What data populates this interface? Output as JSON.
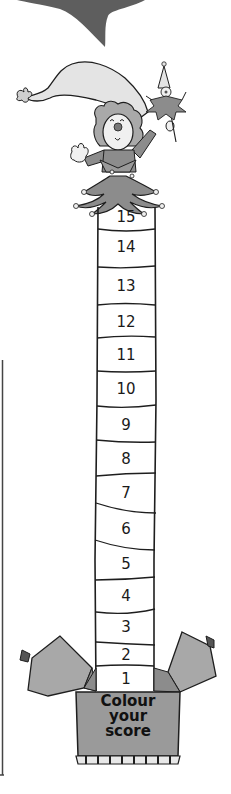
{
  "score_tower": {
    "instruction_lines": [
      "Colour",
      "your",
      "score"
    ],
    "levels": [
      {
        "label": "15",
        "top": 207,
        "bottom": 229
      },
      {
        "label": "14",
        "top": 229,
        "bottom": 267
      },
      {
        "label": "13",
        "top": 267,
        "bottom": 305
      },
      {
        "label": "12",
        "top": 305,
        "bottom": 338
      },
      {
        "label": "11",
        "top": 338,
        "bottom": 372
      },
      {
        "label": "10",
        "top": 372,
        "bottom": 406
      },
      {
        "label": "9",
        "top": 406,
        "bottom": 442
      },
      {
        "label": "8",
        "top": 442,
        "bottom": 476
      },
      {
        "label": "7",
        "top": 476,
        "bottom": 510
      },
      {
        "label": "6",
        "top": 510,
        "bottom": 548
      },
      {
        "label": "5",
        "top": 548,
        "bottom": 580
      },
      {
        "label": "4",
        "top": 580,
        "bottom": 613
      },
      {
        "label": "3",
        "top": 613,
        "bottom": 643
      },
      {
        "label": "2",
        "top": 643,
        "bottom": 667
      },
      {
        "label": "1",
        "top": 667,
        "bottom": 691
      }
    ]
  },
  "colors": {
    "speech_bubble": "#5e5e5e",
    "box_fill": "#9a9a9a",
    "box_flap": "#aaaaaa",
    "hat": "#e4e4e4",
    "costume": "#8c8c8c",
    "outline": "#1e1e1e"
  }
}
